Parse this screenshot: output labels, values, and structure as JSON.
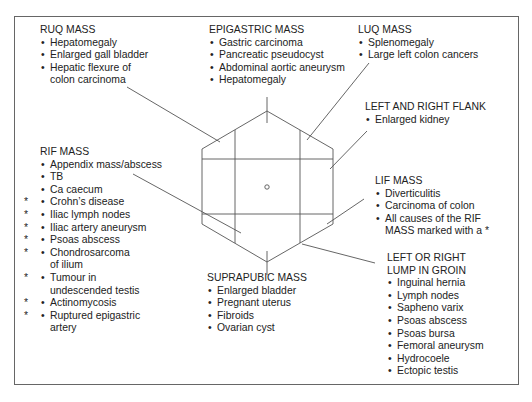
{
  "figure": {
    "center_marker": "umbilicus-circle",
    "regions": [
      {
        "id": "ruq",
        "title": "RUQ MASS",
        "items": [
          {
            "text": "Hepatomegaly"
          },
          {
            "text": "Enlarged gall bladder"
          },
          {
            "text": "Hepatic flexure of",
            "cont": "colon carcinoma"
          }
        ]
      },
      {
        "id": "epigastric",
        "title": "EPIGASTRIC MASS",
        "items": [
          {
            "text": "Gastric carcinoma"
          },
          {
            "text": "Pancreatic pseudocyst"
          },
          {
            "text": "Abdominal aortic aneurysm"
          },
          {
            "text": "Hepatomegaly"
          }
        ]
      },
      {
        "id": "luq",
        "title": "LUQ MASS",
        "items": [
          {
            "text": "Splenomegaly"
          },
          {
            "text": "Large left colon cancers"
          }
        ]
      },
      {
        "id": "flank",
        "title": "LEFT AND RIGHT FLANK",
        "items": [
          {
            "text": "Enlarged kidney"
          }
        ]
      },
      {
        "id": "rif",
        "title": "RIF MASS",
        "items": [
          {
            "text": "Appendix mass/abscess",
            "star": false
          },
          {
            "text": "TB",
            "star": false
          },
          {
            "text": "Ca caecum",
            "star": false
          },
          {
            "text": "Crohn’s disease",
            "star": true
          },
          {
            "text": "Iliac lymph nodes",
            "star": true
          },
          {
            "text": "Iliac artery aneurysm",
            "star": true
          },
          {
            "text": "Psoas abscess",
            "star": true
          },
          {
            "text": "Chondrosarcoma",
            "cont": "of ilium",
            "star": true
          },
          {
            "text": "Tumour in",
            "cont": "undescended testis",
            "star": true
          },
          {
            "text": "Actinomycosis",
            "star": true
          },
          {
            "text": "Ruptured epigastric",
            "cont": "artery",
            "star": true
          }
        ]
      },
      {
        "id": "lif",
        "title": "LIF MASS",
        "items": [
          {
            "text": "Diverticulitis"
          },
          {
            "text": "Carcinoma of colon"
          },
          {
            "text": "All causes of the RIF",
            "cont": "MASS marked with a *"
          }
        ]
      },
      {
        "id": "suprapubic",
        "title": "SUPRAPUBIC MASS",
        "items": [
          {
            "text": "Enlarged bladder"
          },
          {
            "text": "Pregnant uterus"
          },
          {
            "text": "Fibroids"
          },
          {
            "text": "Ovarian cyst"
          }
        ]
      },
      {
        "id": "groin",
        "title": "LEFT OR RIGHT",
        "title2": "LUMP IN GROIN",
        "items": [
          {
            "text": "Inguinal hernia"
          },
          {
            "text": "Lymph nodes"
          },
          {
            "text": "Sapheno varix"
          },
          {
            "text": "Psoas abscess"
          },
          {
            "text": "Psoas bursa"
          },
          {
            "text": "Femoral aneurysm"
          },
          {
            "text": "Hydrocoele"
          },
          {
            "text": "Ectopic testis"
          }
        ]
      }
    ],
    "symbols": {
      "bullet": "•",
      "star": "*"
    },
    "colors": {
      "line": "#555555",
      "text": "#222222",
      "frame": "#666666"
    }
  }
}
